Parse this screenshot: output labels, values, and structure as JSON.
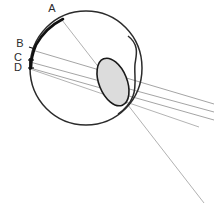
{
  "figure": {
    "background_color": "#ffffff",
    "width": 214,
    "height": 216
  },
  "colors": {
    "outline": "#2b2b2b",
    "retina_arc": "#111111",
    "lens_fill": "#d9d9d9",
    "lens_outline": "#1a1a1a",
    "ray": "#999999",
    "ray_light": "#b0b0b0",
    "label_text": "#2b2b2b"
  },
  "labels": [
    {
      "id": "A",
      "text": "A",
      "x": 52,
      "y": 11
    },
    {
      "id": "B",
      "text": "B",
      "x": 20,
      "y": 47
    },
    {
      "id": "C",
      "text": "C",
      "x": 17,
      "y": 61
    },
    {
      "id": "D",
      "text": "D",
      "x": 17,
      "y": 70
    }
  ],
  "structures": {
    "globe": {
      "name": "eyeball-globe",
      "cx": 86,
      "cy": 68,
      "rx": 56,
      "ry": 57
    },
    "cornea": {
      "name": "cornea-bulge"
    },
    "lens": {
      "name": "crystalline-lens",
      "cx": 113,
      "cy": 82,
      "rx": 14,
      "ry": 24,
      "rotation": -20
    },
    "retina_arc": {
      "name": "retina-highlight-arc",
      "from_label": "A",
      "to_label": "D"
    }
  },
  "rays": [
    {
      "id": "ray-A",
      "origin_label": "A",
      "x1": 62,
      "y1": 20,
      "x2": 214,
      "y2": 216
    },
    {
      "id": "ray-B",
      "origin_label": "B",
      "x1": 32,
      "y1": 50,
      "x2": 214,
      "y2": 105
    },
    {
      "id": "ray-C",
      "origin_label": "C",
      "x1": 30,
      "y1": 62,
      "x2": 214,
      "y2": 112
    },
    {
      "id": "ray-D",
      "origin_label": "D",
      "x1": 30,
      "y1": 68,
      "x2": 214,
      "y2": 122
    },
    {
      "id": "ray-D2",
      "origin_label": "D",
      "x1": 30,
      "y1": 68,
      "x2": 200,
      "y2": 128
    }
  ]
}
